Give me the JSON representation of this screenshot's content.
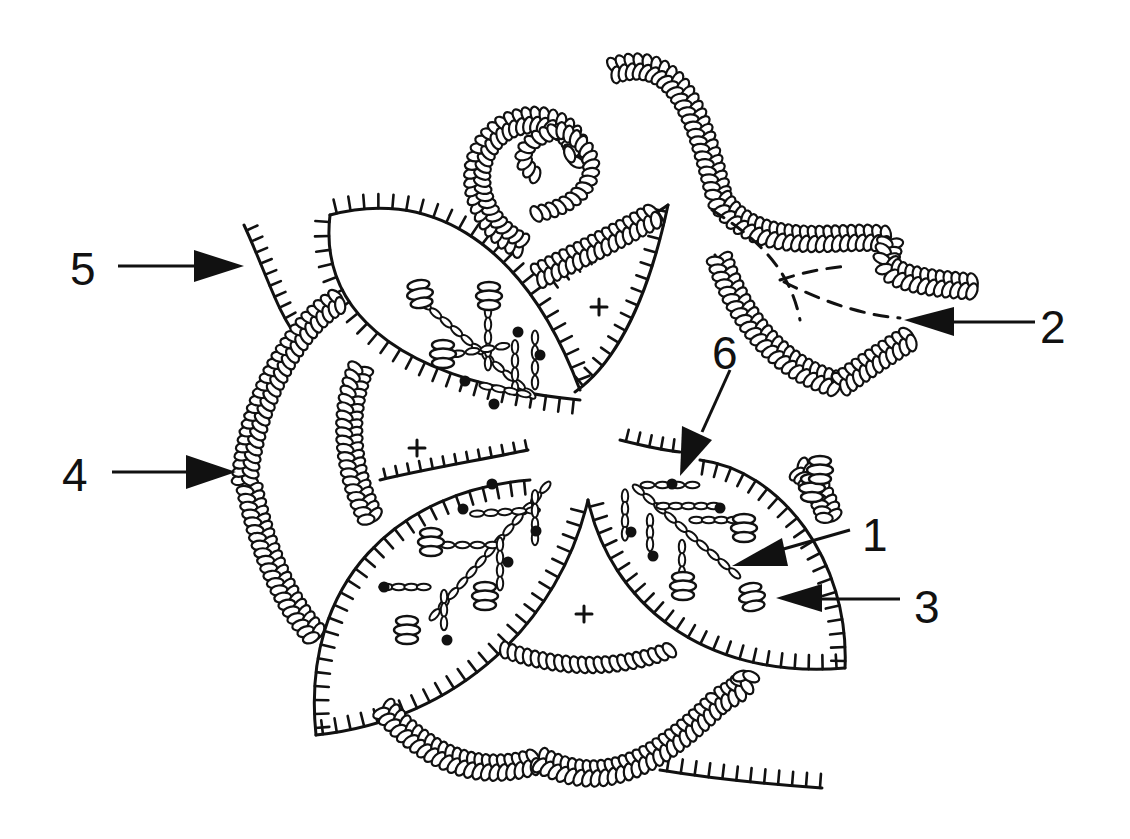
{
  "figure": {
    "type": "embroidery stitch diagram",
    "background": "#ffffff",
    "ink_color": "#111111",
    "center_marks": [
      "+",
      "+",
      "+",
      "+"
    ],
    "stitch_elements": [
      "blanket-stitch edged petals (4)",
      "chain-stitch curled tendrils",
      "lazy daisy stitch sprays",
      "bullion knots",
      "french knot dots",
      "dashed guide lines"
    ]
  },
  "callouts": [
    {
      "id": "1",
      "label": "1",
      "target": "lazy-daisy-spray-stem",
      "x": 858,
      "y": 522
    },
    {
      "id": "2",
      "label": "2",
      "target": "dashed-guide-lines",
      "x": 1038,
      "y": 308
    },
    {
      "id": "3",
      "label": "3",
      "target": "bullion-knot",
      "x": 912,
      "y": 584
    },
    {
      "id": "4",
      "label": "4",
      "target": "chain-stitch-border",
      "x": 62,
      "y": 450
    },
    {
      "id": "5",
      "label": "5",
      "target": "blanket-stitch-edge",
      "x": 70,
      "y": 246
    },
    {
      "id": "6",
      "label": "6",
      "target": "french-knot-dot",
      "x": 690,
      "y": 356
    }
  ]
}
